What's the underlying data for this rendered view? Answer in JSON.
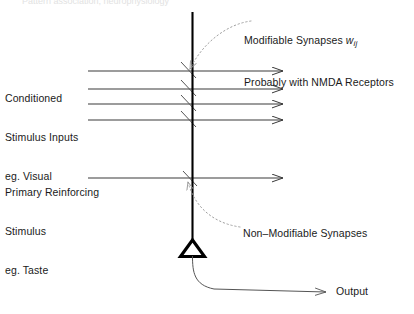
{
  "figure": {
    "title_fragment": "Pattern association, neurophysiology",
    "background_color": "#ffffff",
    "line_color": "#333333",
    "dendrite_color": "#000000",
    "dotted_color": "#999999",
    "text_color": "#1a1a1a"
  },
  "labels": {
    "conditioned_stimulus": {
      "line1": "Conditioned",
      "line2": "Stimulus Inputs",
      "line3": "eg. Visual"
    },
    "primary_reinforcing": {
      "line1": "Primary Reinforcing",
      "line2": "Stimulus",
      "line3": "eg. Taste"
    },
    "modifiable_synapses": {
      "line1_text": "Modifiable Synapses ",
      "line1_symbol": "w",
      "line1_subscript": "ij",
      "line2": "Probably with NMDA Receptors"
    },
    "non_modifiable_synapses": "Non–Modifiable Synapses",
    "output": "Output"
  },
  "diagram_data": {
    "type": "neural-circuit-schematic",
    "dendrite": {
      "x": 192.5,
      "y_top": 12,
      "y_bottom": 242
    },
    "soma_triangle": {
      "cx": 192.5,
      "top_y": 240,
      "bottom_y": 256,
      "half_width": 12
    },
    "conditioned_stimulus_axons": [
      {
        "y": 71,
        "x_start": 88,
        "x_end": 283
      },
      {
        "y": 89,
        "x_start": 88,
        "x_end": 283
      },
      {
        "y": 104,
        "x_start": 88,
        "x_end": 283
      },
      {
        "y": 120,
        "x_start": 88,
        "x_end": 283
      }
    ],
    "primary_reinforcing_axon": {
      "y": 178,
      "x_start": 88,
      "x_end": 283
    },
    "synapse_marks": [
      {
        "y": 71,
        "type": "modifiable"
      },
      {
        "y": 89,
        "type": "modifiable"
      },
      {
        "y": 104,
        "type": "modifiable"
      },
      {
        "y": 120,
        "type": "modifiable"
      },
      {
        "y": 178,
        "type": "non-modifiable"
      }
    ],
    "output_axon": {
      "from_x": 192.5,
      "from_y": 256,
      "to_x": 330,
      "to_y": 292
    },
    "pointer_modifiable": {
      "from_x": 250,
      "from_y": 22,
      "to_x": 190,
      "to_y": 70
    },
    "pointer_non_modifiable": {
      "from_x": 240,
      "from_y": 226,
      "to_x": 189,
      "to_y": 182
    }
  }
}
